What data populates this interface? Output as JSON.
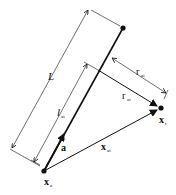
{
  "diagram": {
    "labels": {
      "L": "L",
      "l_ai_main": "l",
      "l_ai_sub": "ai",
      "r_ai_dim_main": "r",
      "r_ai_dim_sub": "ai",
      "r_ai_vec_main": "r",
      "r_ai_vec_sub": "ai",
      "a_hat": "a",
      "a_hat_mark": "^",
      "x_ai_main": "x",
      "x_ai_sub": "ai",
      "x_t_main": "x",
      "x_t_sub": "t",
      "x_a_main": "x",
      "x_a_sub": "a"
    },
    "colors": {
      "stroke": "#111111",
      "background": "#ffffff"
    }
  }
}
